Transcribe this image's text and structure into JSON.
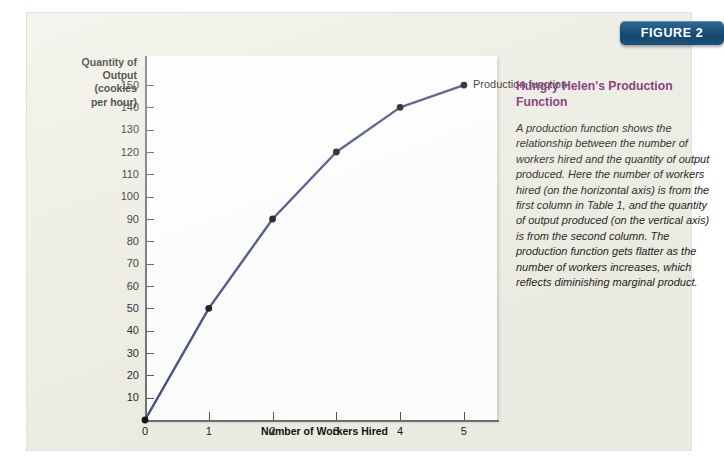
{
  "figure": {
    "badge_label": "FIGURE 2"
  },
  "caption": {
    "title": "Hungry Helen's Production Function",
    "body": "A production function shows the relationship between the number of workers hired and the quantity of output produced. Here the number of workers hired (on the horizontal axis) is from the first column in Table 1, and the quantity of output produced (on the vertical axis) is from the second column. The production function gets flatter as the number of workers increases, which reflects diminishing marginal product."
  },
  "chart_data": {
    "type": "line",
    "title": "",
    "xlabel": "Number of Workers Hired",
    "ylabel": "Quantity of\nOutput\n(cookies\nper hour)",
    "x": [
      0,
      1,
      2,
      3,
      4,
      5
    ],
    "values": [
      0,
      50,
      90,
      120,
      140,
      150
    ],
    "series": [
      {
        "name": "Production function",
        "x": [
          0,
          1,
          2,
          3,
          4,
          5
        ],
        "values": [
          0,
          50,
          90,
          120,
          140,
          150
        ]
      }
    ],
    "xlim": [
      0,
      5.55
    ],
    "ylim": [
      0,
      163
    ],
    "xticks": [
      "0",
      "1",
      "2",
      "3",
      "4",
      "5"
    ],
    "xtick_values": [
      0,
      1,
      2,
      3,
      4,
      5
    ],
    "yticks": [
      "10",
      "20",
      "30",
      "40",
      "50",
      "60",
      "70",
      "80",
      "90",
      "100",
      "110",
      "120",
      "130",
      "140",
      "150"
    ],
    "ytick_values": [
      10,
      20,
      30,
      40,
      50,
      60,
      70,
      80,
      90,
      100,
      110,
      120,
      130,
      140,
      150
    ],
    "annotations": [
      {
        "text": "Production function",
        "x": 5,
        "y": 150
      }
    ],
    "grid": false,
    "legend_position": "none",
    "line_color": "#3f4a80",
    "marker_color": "#101010",
    "plot_background": "#ffffff"
  },
  "theme": {
    "panel_background": "#eeeee4",
    "badge_color": "#1d567f",
    "caption_title_color": "#7b1f6e",
    "axis_color": "#6f6f68"
  }
}
